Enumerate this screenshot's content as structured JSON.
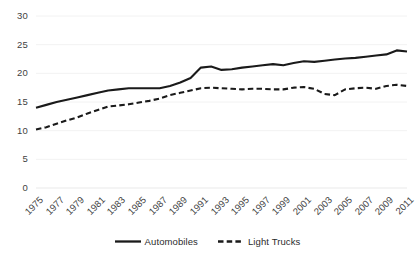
{
  "chart_data": {
    "type": "line",
    "title": "",
    "subtitle": "",
    "xlabel": "",
    "ylabel": "",
    "grid": true,
    "grid_axis": "y",
    "legend_position": "bottom",
    "xlim": [
      1975,
      2011
    ],
    "ylim": [
      0,
      30
    ],
    "ytick_labels": [
      "0",
      "5",
      "10",
      "15",
      "20",
      "25",
      "30"
    ],
    "yticks": [
      0,
      5,
      10,
      15,
      20,
      25,
      30
    ],
    "xtick_labels": [
      "1975",
      "1977",
      "1979",
      "1981",
      "1983",
      "1985",
      "1987",
      "1989",
      "1991",
      "1993",
      "1995",
      "1997",
      "1999",
      "2001",
      "2003",
      "2005",
      "2007",
      "2009",
      "2011"
    ],
    "xticks": [
      1975,
      1977,
      1979,
      1981,
      1983,
      1985,
      1987,
      1989,
      1991,
      1993,
      1995,
      1997,
      1999,
      2001,
      2003,
      2005,
      2007,
      2009,
      2011
    ],
    "x": [
      1975,
      1976,
      1977,
      1978,
      1979,
      1980,
      1981,
      1982,
      1983,
      1984,
      1985,
      1986,
      1987,
      1988,
      1989,
      1990,
      1991,
      1992,
      1993,
      1994,
      1995,
      1996,
      1997,
      1998,
      1999,
      2000,
      2001,
      2002,
      2003,
      2004,
      2005,
      2006,
      2007,
      2008,
      2009,
      2010,
      2011
    ],
    "series": [
      {
        "name": "Automobiles",
        "style": "solid",
        "color": "#1a1a1a",
        "values": [
          14.0,
          14.5,
          15.0,
          15.4,
          15.8,
          16.2,
          16.6,
          17.0,
          17.2,
          17.4,
          17.4,
          17.4,
          17.4,
          17.8,
          18.4,
          19.2,
          21.0,
          21.2,
          20.6,
          20.7,
          21.0,
          21.2,
          21.4,
          21.6,
          21.4,
          21.8,
          22.1,
          22.0,
          22.2,
          22.4,
          22.6,
          22.7,
          22.9,
          23.1,
          23.3,
          24.0,
          23.8
        ]
      },
      {
        "name": "Light Trucks",
        "style": "dashed",
        "color": "#1a1a1a",
        "values": [
          10.2,
          10.6,
          11.2,
          11.8,
          12.3,
          13.0,
          13.6,
          14.2,
          14.4,
          14.6,
          14.9,
          15.2,
          15.6,
          16.2,
          16.6,
          17.0,
          17.4,
          17.5,
          17.4,
          17.3,
          17.2,
          17.3,
          17.3,
          17.2,
          17.2,
          17.5,
          17.6,
          17.3,
          16.4,
          16.2,
          17.2,
          17.4,
          17.5,
          17.3,
          17.8,
          18.0,
          17.8
        ]
      }
    ]
  }
}
